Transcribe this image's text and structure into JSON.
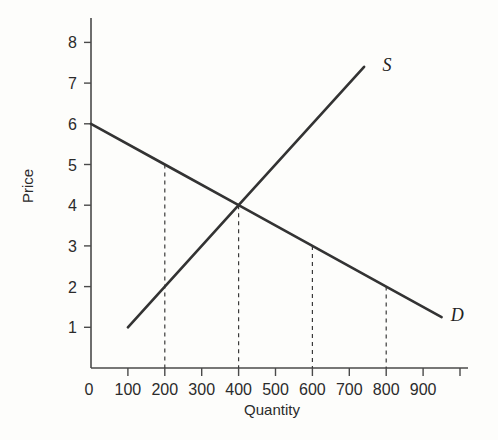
{
  "chart_data": {
    "type": "line",
    "title": "",
    "xlabel": "Quantity",
    "ylabel": "Price",
    "xlim": [
      0,
      1000
    ],
    "ylim": [
      0,
      8.6
    ],
    "grid": false,
    "legend_position": "inline-end-of-line",
    "origin_label": "0",
    "x_ticks": [
      100,
      200,
      300,
      400,
      500,
      600,
      700,
      800,
      900,
      1000
    ],
    "x_tick_labels": [
      "100",
      "200",
      "300",
      "400",
      "500",
      "600",
      "700",
      "800",
      "900",
      ""
    ],
    "y_ticks": [
      1,
      2,
      3,
      4,
      5,
      6,
      7,
      8
    ],
    "y_tick_labels": [
      "1",
      "2",
      "3",
      "4",
      "5",
      "6",
      "7",
      "8"
    ],
    "series": [
      {
        "name": "Demand",
        "label": "D",
        "x": [
          0,
          200,
          400,
          600,
          800,
          950
        ],
        "values": [
          6,
          5,
          4,
          3,
          2,
          1.25
        ],
        "label_x": 975,
        "label_y": 1.3
      },
      {
        "name": "Supply",
        "label": "S",
        "x": [
          100,
          200,
          400,
          740
        ],
        "values": [
          1,
          2,
          4,
          7.4
        ],
        "label_x": 790,
        "label_y": 7.45
      }
    ],
    "equilibrium": {
      "quantity": 400,
      "price": 4
    },
    "droplines": [
      {
        "x": 200,
        "y": 5
      },
      {
        "x": 400,
        "y": 4
      },
      {
        "x": 600,
        "y": 3
      },
      {
        "x": 800,
        "y": 2
      }
    ]
  }
}
